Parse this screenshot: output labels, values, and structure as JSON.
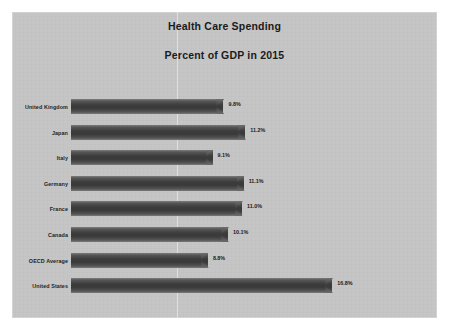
{
  "slide": {
    "title_line_1": "Health Care Spending",
    "title_line_2": "Percent of GDP in 2015"
  },
  "chart_data": {
    "type": "bar",
    "orientation": "horizontal",
    "xlabel": "",
    "ylabel": "",
    "xlim": [
      0,
      18
    ],
    "grid": false,
    "legend": "none",
    "categories": [
      "United Kingdom",
      "Japan",
      "Italy",
      "Germany",
      "France",
      "Canada",
      "OECD Average",
      "United States"
    ],
    "values": [
      9.8,
      11.2,
      9.1,
      11.1,
      11.0,
      10.1,
      8.8,
      16.8
    ],
    "data_labels": [
      "9.8%",
      "11.2%",
      "9.1%",
      "11.1%",
      "11.0%",
      "10.1%",
      "8.8%",
      "16.8%"
    ],
    "series": [
      {
        "name": "Percent of GDP",
        "values": [
          9.8,
          11.2,
          9.1,
          11.1,
          11.0,
          10.1,
          8.8,
          16.8
        ]
      }
    ],
    "colors": {
      "bar": "#3c3c3c",
      "bar_highlight": "#7d7d7d",
      "background": "#c9c9c9",
      "text": "#1b1b1b"
    }
  }
}
